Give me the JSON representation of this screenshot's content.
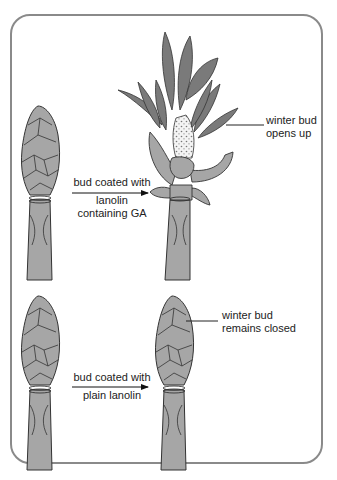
{
  "diagram": {
    "panels": [
      {
        "id": "ga-treated",
        "treatment_label": [
          "bud coated with",
          "lanolin",
          "containing GA"
        ],
        "result_label": [
          "winter bud",
          "opens up"
        ]
      },
      {
        "id": "control",
        "treatment_label": [
          "bud coated with",
          "plain lanolin"
        ],
        "result_label": [
          "winter bud",
          "remains closed"
        ]
      }
    ],
    "colors": {
      "bud_fill": "#a6a6a6",
      "leaf_fill": "#7a7a7a",
      "outline": "#333333",
      "frame": "#8a8a8a",
      "text": "#222222"
    }
  }
}
